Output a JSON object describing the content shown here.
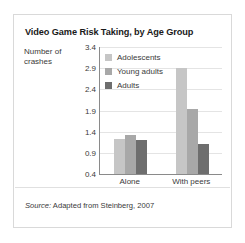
{
  "figure": {
    "title": "Video Game Risk Taking, by Age Group",
    "source_word": "Source:",
    "source_text": " Adapted from Steinberg, 2007"
  },
  "axis": {
    "ylabel_line1": "Number of",
    "ylabel_line2": "crashes",
    "ticks": [
      "3.4",
      "2.9",
      "2.4",
      "1.9",
      "1.4",
      "0.9",
      "0.4"
    ]
  },
  "colors": {
    "adolescents": "#c6c6c6",
    "young_adults": "#a8a8a8",
    "adults": "#6e6e6e",
    "axis": "#8a8a8a",
    "grid": "#e4e4e4",
    "frame": "#d9d9d9",
    "text": "#3a3a3a",
    "title": "#1a1a1a"
  },
  "chart_data": {
    "type": "bar",
    "title": "Video Game Risk Taking, by Age Group",
    "xlabel": "",
    "ylabel": "Number of crashes",
    "ylim": [
      0.4,
      3.4
    ],
    "ytick_step": 0.5,
    "yticks": [
      0.4,
      0.9,
      1.4,
      1.9,
      2.4,
      2.9,
      3.4
    ],
    "grid": true,
    "legend_position": "inside-top-left",
    "categories": [
      "Alone",
      "With peers"
    ],
    "series": [
      {
        "name": "Adolescents",
        "color": "#c6c6c6",
        "values": [
          1.22,
          2.9
        ]
      },
      {
        "name": "Young adults",
        "color": "#a8a8a8",
        "values": [
          1.31,
          1.93
        ]
      },
      {
        "name": "Adults",
        "color": "#6e6e6e",
        "values": [
          1.2,
          1.12
        ]
      }
    ],
    "annotations": [
      "Source: Adapted from Steinberg, 2007"
    ]
  }
}
